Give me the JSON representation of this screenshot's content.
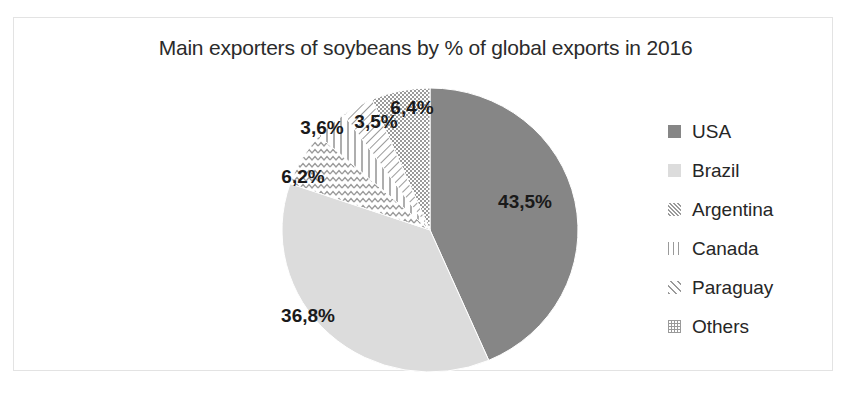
{
  "chart_data": {
    "type": "pie",
    "title": "Main exporters of soybeans by % of global exports in 2016",
    "xlabel": "",
    "ylabel": "",
    "unit": "%",
    "decimal_separator": ",",
    "legend_position": "right",
    "start_angle_deg": 0,
    "direction": "clockwise",
    "categories": [
      "USA",
      "Brazil",
      "Argentina",
      "Canada",
      "Paraguay",
      "Others"
    ],
    "values": [
      43.5,
      36.8,
      6.2,
      3.6,
      3.5,
      6.4
    ],
    "labels": [
      "43,5%",
      "36,8%",
      "6,2%",
      "3,6%",
      "3,5%",
      "6,4%"
    ],
    "slices": [
      {
        "name": "USA",
        "value": 43.5,
        "label": "43,5%",
        "fill": "#868686",
        "pattern": "solid-dark",
        "label_x": 525,
        "label_y": 208
      },
      {
        "name": "Brazil",
        "value": 36.8,
        "label": "36,8%",
        "fill": "#dcdcdc",
        "pattern": "solid-light",
        "label_x": 308,
        "label_y": 322
      },
      {
        "name": "Argentina",
        "value": 6.2,
        "label": "6,2%",
        "fill": "#ffffff",
        "pattern": "zigzag",
        "label_x": 303,
        "label_y": 183
      },
      {
        "name": "Canada",
        "value": 3.6,
        "label": "3,6%",
        "fill": "#ffffff",
        "pattern": "vertical",
        "label_x": 322,
        "label_y": 134
      },
      {
        "name": "Paraguay",
        "value": 3.5,
        "label": "3,5%",
        "fill": "#ffffff",
        "pattern": "diagonal",
        "label_x": 376,
        "label_y": 128
      },
      {
        "name": "Others",
        "value": 6.4,
        "label": "6,4%",
        "fill": "#ffffff",
        "pattern": "checker",
        "label_x": 412,
        "label_y": 114
      }
    ]
  },
  "legend": {
    "items": [
      {
        "label": "USA",
        "swatch": "solid-dark-swatch"
      },
      {
        "label": "Brazil",
        "swatch": "solid-light-swatch"
      },
      {
        "label": "Argentina",
        "swatch": "zigzag-swatch"
      },
      {
        "label": "Canada",
        "swatch": "vertical-lines-swatch"
      },
      {
        "label": "Paraguay",
        "swatch": "diagonal-lines-swatch"
      },
      {
        "label": "Others",
        "swatch": "checker-swatch"
      }
    ]
  },
  "colors": {
    "usa": "#868686",
    "brazil": "#dcdcdc",
    "pattern_stroke": "#9a9a9a",
    "text": "#262626",
    "background": "#ffffff",
    "frame": "#e3e3e3"
  }
}
